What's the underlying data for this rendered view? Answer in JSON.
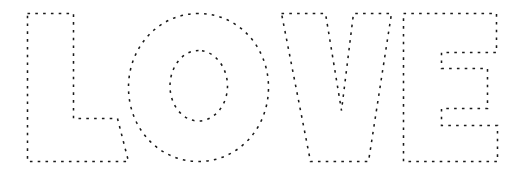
{
  "artwork": {
    "title": "LOVE",
    "description": "Dotted outline tracing template of the word LOVE",
    "style": "dotted-outline",
    "letters": [
      "L",
      "O",
      "V",
      "E"
    ],
    "letter_count": 4,
    "stroke_color": "#1a1a1a",
    "background_color": "#ffffff",
    "stroke_width": 1.55,
    "dash_pattern": "2.6 5.2"
  },
  "canvas": {
    "width": 516,
    "height": 181,
    "baseline_y": 161,
    "cap_y": 13
  },
  "glyphs": [
    {
      "name": "letter-l",
      "char": "L",
      "bbox": [
        27,
        13,
        128,
        162
      ],
      "path": "M 27.5 13.5 L 73.5 13.5 L 73.5 118.5 L 117.5 118.5 L 128.5 161.5 L 27.5 161.5 Z"
    },
    {
      "name": "letter-o",
      "char": "O",
      "bbox": [
        128,
        13,
        268,
        162
      ],
      "outer_path": "M 198.5 13.5 C 159.0 13.5 128.5 46.5 128.5 87.5 C 128.5 128.5 159.0 161.5 198.5 161.5 C 238.0 161.5 268.5 128.5 268.5 87.5 C 268.5 46.5 238.0 13.5 198.5 13.5 Z",
      "inner_path": "M 198.5 50.5 C 182.5 50.5 170.0 67.0 170.0 86.0 C 170.0 105.0 182.5 121.0 198.5 121.0 C 214.5 121.0 227.5 105.0 227.5 86.0 C 227.5 67.0 214.5 50.5 198.5 50.5 Z"
    },
    {
      "name": "letter-v",
      "char": "V",
      "bbox": [
        268,
        13,
        392,
        162
      ],
      "path": "M 281.5 13.5 L 325.5 13.5 L 341.5 110.5 L 353.5 13.5 L 391.5 13.5 L 368.5 161.5 L 310.5 161.5 Z"
    },
    {
      "name": "letter-e",
      "char": "E",
      "bbox": [
        403,
        13,
        497,
        162
      ],
      "path": "M 403.5 13.5 L 496.5 13.5 L 496.5 52.5 L 441.5 52.5 L 441.5 68.5 L 487.5 68.5 L 487.5 108.5 L 441.5 108.5 L 441.5 125.5 L 497.5 125.5 L 497.5 161.5 L 403.5 161.5 Z"
    }
  ]
}
